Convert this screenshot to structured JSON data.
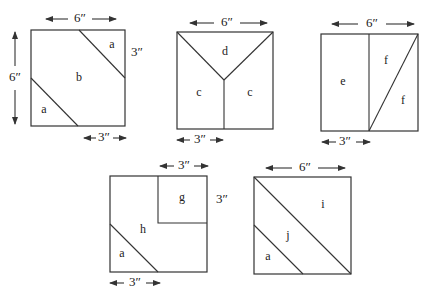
{
  "figure": {
    "blocks": [
      {
        "id": "block-1",
        "pieces": [
          {
            "label": "a"
          },
          {
            "label": "b"
          },
          {
            "label": "a"
          }
        ],
        "dimensions": {
          "top": "6″",
          "left": "6″",
          "right": "3″",
          "bottom": "3″"
        }
      },
      {
        "id": "block-2",
        "pieces": [
          {
            "label": "d"
          },
          {
            "label": "c"
          },
          {
            "label": "c"
          }
        ],
        "dimensions": {
          "top": "6″",
          "bottom": "3″"
        }
      },
      {
        "id": "block-3",
        "pieces": [
          {
            "label": "e"
          },
          {
            "label": "f"
          },
          {
            "label": "f"
          }
        ],
        "dimensions": {
          "top": "6″",
          "bottom": "3″"
        }
      },
      {
        "id": "block-4",
        "pieces": [
          {
            "label": "g"
          },
          {
            "label": "h"
          },
          {
            "label": "a"
          }
        ],
        "dimensions": {
          "top": "3″",
          "right": "3″",
          "bottom": "3″"
        }
      },
      {
        "id": "block-5",
        "pieces": [
          {
            "label": "i"
          },
          {
            "label": "j"
          },
          {
            "label": "a"
          }
        ],
        "dimensions": {
          "top": "6″"
        }
      }
    ]
  }
}
